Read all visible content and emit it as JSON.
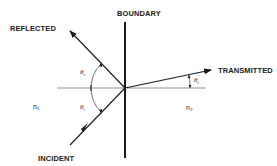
{
  "diagram": {
    "type": "optics-refraction-reflection",
    "labels": {
      "boundary": "BOUNDARY",
      "reflected": "REFLECTED",
      "transmitted": "TRANSMITTED",
      "incident": "INCIDENT",
      "medium1": "n₁",
      "medium2": "n₂"
    },
    "angles": {
      "reflected": {
        "symbol": "θ",
        "subscript": "r"
      },
      "incident": {
        "symbol": "θ",
        "subscript": "i"
      },
      "transmitted": {
        "symbol": "θ",
        "subscript": "t"
      }
    },
    "colors": {
      "line": "#1a1a1a",
      "normal": "#555555",
      "background": "#ffffff"
    }
  }
}
